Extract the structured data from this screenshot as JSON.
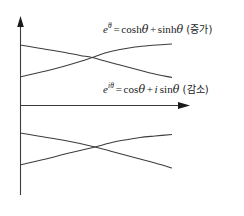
{
  "figure": {
    "background_color": "#ffffff",
    "line_color": "#3c3c3c",
    "text_color": "#1a1a1a"
  },
  "axes": {
    "y_axis_name": "vertical-axis",
    "x_axis_name": "horizontal-axis",
    "y_axis": {
      "x": 20,
      "y_top": 18,
      "y_bottom": 195,
      "arrow": "up"
    },
    "x_axis": {
      "y": 105,
      "x_left": 20,
      "x_right": 188,
      "arrow": "right"
    },
    "origin": {
      "x": 20,
      "y": 105
    },
    "ticks": [],
    "tick_labels": [],
    "grid": false
  },
  "labels": {
    "growth": {
      "base": "e",
      "exponent": "θ",
      "equals": "=",
      "term1_fn": "cosh",
      "term1_arg": "θ",
      "plus": "+",
      "term2_fn": "sinh",
      "term2_arg": "θ",
      "annotation": "(증가)",
      "full_text": "e^θ = coshθ + sinhθ (증가)"
    },
    "oscillation": {
      "base": "e",
      "exponent": "iθ",
      "equals": "=",
      "term1_fn": "cos",
      "term1_arg": "θ",
      "plus": "+",
      "term2_imag": "i",
      "term2_fn": "sin",
      "term2_arg": "θ",
      "annotation": "(감소)",
      "full_text": "e^(iθ) = cosθ + i sinθ (감소)"
    }
  },
  "chart_data": {
    "type": "line",
    "title": "",
    "xlabel": "",
    "ylabel": "",
    "xlim": [
      20,
      188
    ],
    "ylim": [
      216,
      0
    ],
    "grid": false,
    "legend_position": "inline-annotations",
    "series": [
      {
        "name": "upper-growth-curve",
        "description": "rising exponential, upper band",
        "annotation": "e^θ = coshθ + sinhθ (증가)",
        "points": [
          [
            20,
            77
          ],
          [
            35,
            73.5
          ],
          [
            50,
            70
          ],
          [
            65,
            66
          ],
          [
            80,
            61.5
          ],
          [
            92,
            57.5
          ],
          [
            105,
            53
          ],
          [
            120,
            49.5
          ],
          [
            135,
            47
          ],
          [
            150,
            45.5
          ],
          [
            172,
            44
          ]
        ]
      },
      {
        "name": "upper-decay-curve",
        "description": "falling exponential, upper band",
        "annotation": "e^θ = coshθ + sinhθ (증가)",
        "points": [
          [
            20,
            45
          ],
          [
            35,
            47.5
          ],
          [
            50,
            50
          ],
          [
            65,
            52.5
          ],
          [
            80,
            55.5
          ],
          [
            92,
            57.5
          ],
          [
            105,
            61
          ],
          [
            120,
            65
          ],
          [
            135,
            69
          ],
          [
            150,
            73
          ],
          [
            172,
            77.5
          ]
        ]
      },
      {
        "name": "lower-decay-curve",
        "description": "falling curve, lower band",
        "annotation": "e^(iθ) = cosθ + i sinθ (감소)",
        "points": [
          [
            20,
            133
          ],
          [
            35,
            135.5
          ],
          [
            50,
            138
          ],
          [
            65,
            140.5
          ],
          [
            80,
            143.5
          ],
          [
            95,
            147
          ],
          [
            110,
            151
          ],
          [
            125,
            155
          ],
          [
            140,
            159
          ],
          [
            155,
            163
          ],
          [
            172,
            168
          ]
        ]
      },
      {
        "name": "lower-growth-curve",
        "description": "rising curve, lower band",
        "annotation": "e^(iθ) = cosθ + i sinθ (감소)",
        "points": [
          [
            20,
            165
          ],
          [
            35,
            161.5
          ],
          [
            50,
            158
          ],
          [
            65,
            154
          ],
          [
            80,
            150.5
          ],
          [
            95,
            147
          ],
          [
            110,
            143
          ],
          [
            125,
            140
          ],
          [
            140,
            137.5
          ],
          [
            155,
            136
          ],
          [
            172,
            134.5
          ]
        ]
      }
    ],
    "crossings": [
      {
        "name": "upper-crossing",
        "x": 92,
        "y": 57.5
      },
      {
        "name": "lower-crossing",
        "x": 95,
        "y": 147
      }
    ]
  }
}
